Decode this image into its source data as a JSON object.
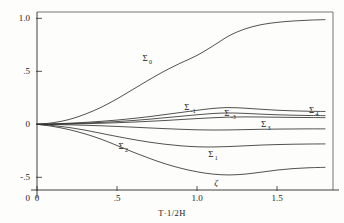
{
  "figure": {
    "name": "sigma-curves-figure",
    "background_color": "#fdfdfb",
    "ink_color": "#33332f"
  },
  "chart_data": {
    "type": "line",
    "title": "",
    "subtitle": "",
    "xlabel": "T·1/2H",
    "ylabel": "",
    "xlim": [
      0,
      1.85
    ],
    "ylim": [
      -0.62,
      1.06
    ],
    "grid": false,
    "legend_position": "inline-curve-labels",
    "xticks": [
      0,
      0.5,
      1.0,
      1.5
    ],
    "xtick_labels": [
      "0",
      ".5",
      "1.0",
      "1.5"
    ],
    "yticks": [
      -0.5,
      0,
      0.5,
      1.0
    ],
    "ytick_labels": [
      "-.5",
      "0",
      ".5",
      "1.0"
    ],
    "annotations": [
      {
        "text": "ζ",
        "x": 1.12,
        "y": -0.58,
        "name": "zeta-critical-point"
      }
    ],
    "series": [
      {
        "name": "Σ₀",
        "label_base": "Σ",
        "label_sub": "0",
        "label_x": 0.66,
        "label_y": 0.6,
        "x": [
          0.0,
          0.1,
          0.2,
          0.3,
          0.4,
          0.5,
          0.6,
          0.7,
          0.8,
          0.9,
          1.0,
          1.1,
          1.2,
          1.3,
          1.4,
          1.5,
          1.6,
          1.7,
          1.8
        ],
        "y": [
          0.0,
          0.015,
          0.045,
          0.095,
          0.16,
          0.24,
          0.33,
          0.42,
          0.505,
          0.58,
          0.65,
          0.74,
          0.835,
          0.9,
          0.94,
          0.962,
          0.975,
          0.983,
          0.988
        ]
      },
      {
        "name": "Σ₋₁",
        "label_base": "Σ",
        "label_sub": "-1",
        "label_x": 0.92,
        "label_y": 0.135,
        "x": [
          0.0,
          0.1,
          0.2,
          0.3,
          0.4,
          0.5,
          0.6,
          0.7,
          0.8,
          0.9,
          1.0,
          1.1,
          1.2,
          1.3,
          1.4,
          1.5,
          1.6,
          1.7,
          1.8
        ],
        "y": [
          0.0,
          0.004,
          0.01,
          0.018,
          0.028,
          0.04,
          0.055,
          0.072,
          0.092,
          0.112,
          0.132,
          0.15,
          0.158,
          0.152,
          0.142,
          0.133,
          0.127,
          0.123,
          0.121
        ]
      },
      {
        "name": "Σ₋₃",
        "label_base": "Σ",
        "label_sub": "-3",
        "label_x": 1.17,
        "label_y": 0.075,
        "x": [
          0.0,
          0.1,
          0.2,
          0.3,
          0.4,
          0.5,
          0.6,
          0.7,
          0.8,
          0.9,
          1.0,
          1.1,
          1.2,
          1.3,
          1.4,
          1.5,
          1.6,
          1.7,
          1.8
        ],
        "y": [
          0.0,
          0.002,
          0.006,
          0.011,
          0.018,
          0.026,
          0.036,
          0.048,
          0.062,
          0.076,
          0.09,
          0.102,
          0.107,
          0.103,
          0.096,
          0.09,
          0.086,
          0.083,
          0.082
        ]
      },
      {
        "name": "Σ₄",
        "label_base": "Σ",
        "label_sub": "4",
        "label_x": 1.7,
        "label_y": 0.105,
        "x": [
          0.0,
          0.1,
          0.2,
          0.3,
          0.4,
          0.5,
          0.6,
          0.7,
          0.8,
          0.9,
          1.0,
          1.1,
          1.2,
          1.3,
          1.4,
          1.5,
          1.6,
          1.7,
          1.8
        ],
        "y": [
          0.0,
          0.001,
          0.003,
          0.006,
          0.01,
          0.015,
          0.021,
          0.028,
          0.036,
          0.045,
          0.054,
          0.062,
          0.068,
          0.07,
          0.069,
          0.067,
          0.065,
          0.064,
          0.063
        ]
      },
      {
        "name": "Σ₃",
        "label_base": "Σ",
        "label_sub": "3",
        "label_x": 1.4,
        "label_y": -0.03,
        "x": [
          0.0,
          0.1,
          0.2,
          0.3,
          0.4,
          0.5,
          0.6,
          0.7,
          0.8,
          0.9,
          1.0,
          1.1,
          1.2,
          1.3,
          1.4,
          1.5,
          1.6,
          1.7,
          1.8
        ],
        "y": [
          0.0,
          -0.002,
          -0.005,
          -0.009,
          -0.014,
          -0.02,
          -0.027,
          -0.034,
          -0.041,
          -0.047,
          -0.052,
          -0.054,
          -0.053,
          -0.05,
          -0.047,
          -0.045,
          -0.044,
          -0.043,
          -0.043
        ]
      },
      {
        "name": "Σ₂",
        "label_base": "Σ",
        "label_sub": "2",
        "label_x": 0.51,
        "label_y": -0.235,
        "x": [
          0.0,
          0.1,
          0.2,
          0.3,
          0.4,
          0.5,
          0.6,
          0.7,
          0.8,
          0.9,
          1.0,
          1.1,
          1.2,
          1.3,
          1.4,
          1.5,
          1.6,
          1.7,
          1.8
        ],
        "y": [
          0.0,
          -0.012,
          -0.03,
          -0.055,
          -0.085,
          -0.115,
          -0.143,
          -0.168,
          -0.188,
          -0.203,
          -0.212,
          -0.214,
          -0.21,
          -0.203,
          -0.196,
          -0.191,
          -0.188,
          -0.186,
          -0.185
        ]
      },
      {
        "name": "Σ₁",
        "label_base": "Σ",
        "label_sub": "1",
        "label_x": 1.07,
        "label_y": -0.31,
        "x": [
          0.0,
          0.1,
          0.2,
          0.3,
          0.4,
          0.5,
          0.6,
          0.7,
          0.8,
          0.9,
          1.0,
          1.1,
          1.2,
          1.3,
          1.4,
          1.5,
          1.6,
          1.7,
          1.8
        ],
        "y": [
          0.0,
          -0.02,
          -0.05,
          -0.09,
          -0.14,
          -0.2,
          -0.262,
          -0.32,
          -0.372,
          -0.415,
          -0.448,
          -0.47,
          -0.478,
          -0.47,
          -0.452,
          -0.432,
          -0.418,
          -0.41,
          -0.406
        ]
      }
    ]
  }
}
